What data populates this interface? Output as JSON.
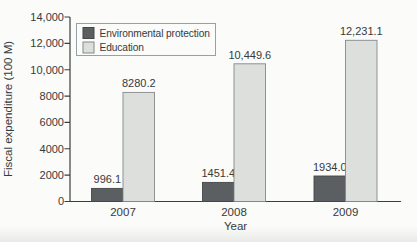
{
  "chart_data": {
    "type": "bar",
    "title": "",
    "xlabel": "Year",
    "ylabel": "Fiscal expenditure (100 M)",
    "categories": [
      "2007",
      "2008",
      "2009"
    ],
    "series": [
      {
        "name": "Environmental protection",
        "color": "#5b5f61",
        "border_color": "#44484a",
        "values": [
          996.1,
          1451.4,
          1934.0
        ],
        "value_labels": [
          "996.1",
          "1451.4",
          "1934.0"
        ]
      },
      {
        "name": "Education",
        "color": "#dddfdc",
        "border_color": "#83898a",
        "values": [
          8280.2,
          10449.6,
          12231.1
        ],
        "value_labels": [
          "8280.2",
          "10,449.6",
          "12,231.1"
        ]
      }
    ],
    "ylim": [
      0,
      14000
    ],
    "ytick_values": [
      0,
      2000,
      4000,
      6000,
      8000,
      10000,
      12000,
      14000
    ],
    "ytick_labels": [
      "0",
      "2000",
      "4000",
      "6000",
      "8000",
      "10,000",
      "12,000",
      "14,000"
    ],
    "legend_position": "top-left",
    "grid": false
  },
  "colors": {
    "axis": "#3a3e40",
    "text": "#363a3c",
    "background": "#fbfbf9",
    "legend_border": "#9aa0a2"
  }
}
